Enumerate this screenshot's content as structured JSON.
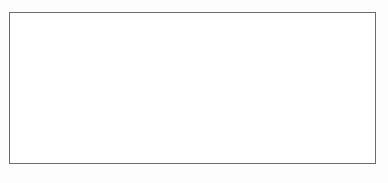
{
  "figure": {
    "caption_faint": "",
    "background_color": "#fdfdfd",
    "frame_color": "#6b6b6b",
    "band_color": "#c9c9c9",
    "stem_color": "#5d5d5d",
    "gridline_color": "#555555",
    "marker_color": "#9b9b9b"
  },
  "chart_data": {
    "type": "line",
    "title": "",
    "subtitle": "",
    "xlabel": "",
    "ylabel": "",
    "grid": true,
    "legend_position": "none",
    "xlim": [
      0,
      36
    ],
    "ylim": [
      0,
      15
    ],
    "xticks": [],
    "yticks": [],
    "xtick_labels": [],
    "ytick_labels": [],
    "annotations": [],
    "n_vertical_series": 36,
    "n_horizontal_gridlines": 15,
    "x": [
      1,
      2,
      3,
      4,
      5,
      6,
      7,
      8,
      9,
      10,
      11,
      12,
      13,
      14,
      15,
      16,
      17,
      18,
      19,
      20,
      21,
      22,
      23,
      24,
      25,
      26,
      27,
      28,
      29,
      30,
      31,
      32,
      33,
      34,
      35,
      36
    ],
    "series": [
      {
        "name": "band-top",
        "values": [
          1.2,
          0.8,
          1.0,
          1.4,
          0.9,
          1.1,
          1.3,
          0.7,
          1.0,
          1.2,
          0.8,
          1.4,
          1.0,
          0.9,
          1.3,
          1.1,
          0.8,
          1.2,
          1.0,
          1.4,
          0.9,
          1.1,
          1.3,
          0.8,
          1.0,
          1.2,
          1.4,
          0.9,
          1.1,
          1.0,
          1.3,
          0.8,
          1.2,
          1.0,
          1.1,
          0.9
        ]
      },
      {
        "name": "band-bottom",
        "values": [
          14.2,
          13.8,
          14.0,
          13.6,
          14.1,
          13.9,
          14.3,
          13.7,
          14.0,
          14.2,
          13.8,
          13.5,
          14.0,
          13.9,
          14.3,
          14.1,
          13.8,
          14.2,
          14.0,
          13.6,
          13.9,
          14.1,
          14.3,
          13.8,
          14.0,
          14.2,
          13.5,
          13.9,
          14.1,
          14.0,
          14.3,
          13.8,
          14.2,
          14.0,
          14.1,
          13.9
        ]
      },
      {
        "name": "node-upper",
        "values": [
          3.1,
          2.4,
          4.0,
          3.5,
          2.8,
          4.2,
          3.0,
          2.6,
          3.8,
          4.1,
          2.9,
          3.3,
          4.0,
          2.5,
          3.6,
          3.1,
          4.2,
          2.7,
          3.4,
          3.9,
          2.6,
          4.1,
          3.0,
          3.5,
          2.8,
          4.0,
          3.2,
          2.9,
          3.7,
          3.1,
          4.2,
          2.6,
          3.5,
          3.0,
          3.8,
          2.7
        ]
      },
      {
        "name": "node-mid",
        "values": [
          7.5,
          8.1,
          6.9,
          7.8,
          8.3,
          7.1,
          6.8,
          8.0,
          7.4,
          6.9,
          8.2,
          7.6,
          7.0,
          8.4,
          7.2,
          6.8,
          7.9,
          8.1,
          7.3,
          6.9,
          8.0,
          7.5,
          7.1,
          8.3,
          7.6,
          6.9,
          8.2,
          7.4,
          7.0,
          8.1,
          7.5,
          6.8,
          7.9,
          8.0,
          7.2,
          7.6
        ]
      },
      {
        "name": "node-lower",
        "values": [
          11.2,
          10.6,
          11.8,
          10.9,
          11.4,
          12.0,
          10.7,
          11.3,
          11.9,
          10.8,
          11.5,
          12.1,
          10.6,
          11.2,
          11.7,
          10.9,
          11.4,
          12.0,
          10.7,
          11.3,
          11.8,
          10.8,
          11.5,
          12.1,
          10.6,
          11.2,
          11.9,
          10.9,
          11.4,
          12.0,
          10.7,
          11.3,
          11.8,
          10.8,
          11.5,
          12.1
        ]
      }
    ]
  },
  "axes": {
    "left_dot_count": 16,
    "right_dot_count": 16,
    "bottom_dot_count": 37,
    "top_dot_count": 37
  }
}
